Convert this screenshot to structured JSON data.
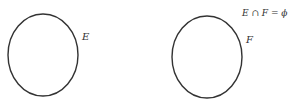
{
  "diagram": {
    "sets": [
      {
        "label": "E",
        "cx": 43,
        "cy": 55,
        "rx": 35,
        "ry": 41
      },
      {
        "label": "F",
        "cx": 207,
        "cy": 57,
        "rx": 35,
        "ry": 41
      }
    ],
    "caption": "E ∩ F = ϕ",
    "stroke_color": "#333333"
  }
}
